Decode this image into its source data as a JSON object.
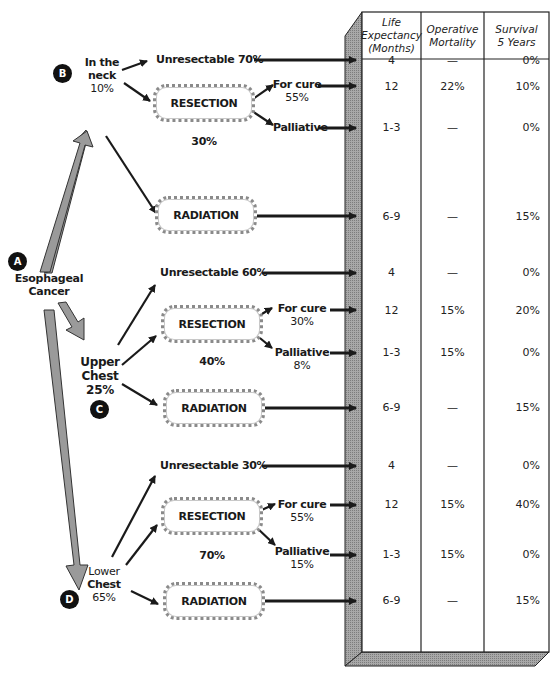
{
  "diagram": {
    "root": {
      "badge": "A",
      "label_line1": "Esophageal",
      "label_line2": "Cancer"
    },
    "table": {
      "headers": [
        {
          "line1": "Life",
          "line2": "Expectancy",
          "line3": "(Months)"
        },
        {
          "line1": "Operative",
          "line2": "Mortality"
        },
        {
          "line1": "Survival",
          "line2": "5 Years"
        }
      ]
    },
    "sections": [
      {
        "badge": "B",
        "location_line1": "In the",
        "location_line2": "neck",
        "location_pct": "10%",
        "unresectable": "Unresectable 70%",
        "resection_label": "RESECTION",
        "resection_pct": "30%",
        "for_cure": "For cure",
        "for_cure_pct": "55%",
        "palliative": "Palliative",
        "palliative_pct": "",
        "radiation_label": "RADIATION",
        "rows": [
          {
            "life": "4",
            "mortality": "—",
            "survival": "0%"
          },
          {
            "life": "12",
            "mortality": "22%",
            "survival": "10%"
          },
          {
            "life": "1-3",
            "mortality": "—",
            "survival": "0%"
          },
          {
            "life": "6-9",
            "mortality": "—",
            "survival": "15%"
          }
        ]
      },
      {
        "badge": "C",
        "location_line1": "Upper",
        "location_line2": "Chest",
        "location_pct": "25%",
        "unresectable": "Unresectable 60%",
        "resection_label": "RESECTION",
        "resection_pct": "40%",
        "for_cure": "For cure",
        "for_cure_pct": "30%",
        "palliative": "Palliative",
        "palliative_pct": "8%",
        "radiation_label": "RADIATION",
        "rows": [
          {
            "life": "4",
            "mortality": "—",
            "survival": "0%"
          },
          {
            "life": "12",
            "mortality": "15%",
            "survival": "20%"
          },
          {
            "life": "1-3",
            "mortality": "15%",
            "survival": "0%"
          },
          {
            "life": "6-9",
            "mortality": "—",
            "survival": "15%"
          }
        ]
      },
      {
        "badge": "D",
        "location_line1": "Lower",
        "location_line2": "Chest",
        "location_pct": "65%",
        "unresectable": "Unresectable 30%",
        "resection_label": "RESECTION",
        "resection_pct": "70%",
        "for_cure": "For cure",
        "for_cure_pct": "55%",
        "palliative": "Palliative",
        "palliative_pct": "15%",
        "radiation_label": "RADIATION",
        "rows": [
          {
            "life": "4",
            "mortality": "—",
            "survival": "0%"
          },
          {
            "life": "12",
            "mortality": "15%",
            "survival": "40%"
          },
          {
            "life": "1-3",
            "mortality": "15%",
            "survival": "0%"
          },
          {
            "life": "6-9",
            "mortality": "—",
            "survival": "15%"
          }
        ]
      }
    ],
    "colors": {
      "ink": "#1a1a1a",
      "gray_arrow": "#9a9a9a",
      "box_border": "#8a8a8a",
      "badge": "#111111"
    }
  }
}
